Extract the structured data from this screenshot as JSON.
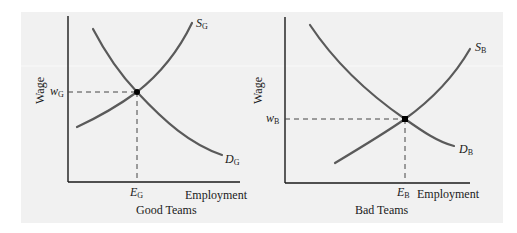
{
  "figure": {
    "panels": [
      {
        "id": "good",
        "title": "Good Teams",
        "y_axis_label": "Wage",
        "x_axis_label": "Employment",
        "wage_label": {
          "main": "w",
          "sub": "G"
        },
        "employment_label": {
          "main": "E",
          "sub": "G"
        },
        "supply_label": {
          "main": "S",
          "sub": "G"
        },
        "demand_label": {
          "main": "D",
          "sub": "G"
        }
      },
      {
        "id": "bad",
        "title": "Bad Teams",
        "y_axis_label": "Wage",
        "x_axis_label": "Employment",
        "wage_label": {
          "main": "w",
          "sub": "B"
        },
        "employment_label": {
          "main": "E",
          "sub": "B"
        },
        "supply_label": {
          "main": "S",
          "sub": "B"
        },
        "demand_label": {
          "main": "D",
          "sub": "B"
        }
      }
    ],
    "colors": {
      "background": "#f1f1f1",
      "curve": "#5a5a5a",
      "axis": "#1a1a1a"
    }
  }
}
